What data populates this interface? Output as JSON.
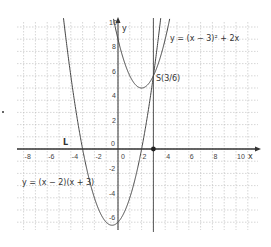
{
  "chart_data": {
    "type": "line",
    "title": "",
    "xlabel": "x",
    "ylabel": "y",
    "xlim": [
      -8.5,
      10.8
    ],
    "ylim": [
      -6.5,
      10.3
    ],
    "grid": true,
    "x_ticks": [
      -8,
      -6,
      -4,
      -2,
      0,
      2,
      4,
      6,
      8,
      10
    ],
    "y_ticks": [
      -6,
      -4,
      -2,
      0,
      2,
      4,
      6,
      8,
      10
    ],
    "series": [
      {
        "name": "y = (x - 3)^2 + 2x",
        "expression": "(x-3)^2+2x",
        "vertex": [
          2,
          5
        ],
        "y_intercept": 9
      },
      {
        "name": "y = (x - 2)(x + 3)",
        "expression": "(x-2)(x+3)",
        "roots": [
          -3,
          2
        ],
        "vertex": [
          -0.5,
          -6.25
        ],
        "y_intercept": -6
      },
      {
        "name": "vertical line x = 3",
        "expression": "x=3"
      }
    ],
    "annotations": [
      {
        "text": "S(3/6)",
        "x": 3,
        "y": 6,
        "type": "intersection-point"
      },
      {
        "text": "L",
        "x": -5,
        "y": 0.5,
        "type": "label"
      },
      {
        "text": "point on x-axis",
        "x": 3,
        "y": 0,
        "type": "point"
      }
    ]
  },
  "labels": {
    "curve1": "y = (x − 3)² + 2x",
    "curve2": "y = (x − 2)(x + 3)",
    "intersection": "S(3/6)",
    "line_label": "L",
    "x_axis": "x",
    "y_axis": "y",
    "origin": "0"
  }
}
